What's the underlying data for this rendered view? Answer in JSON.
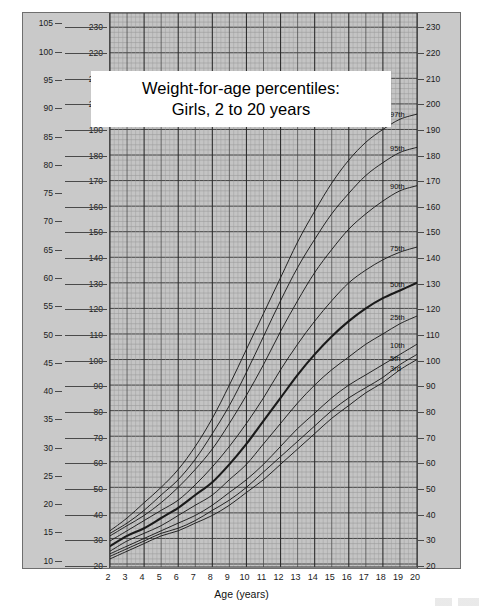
{
  "title": {
    "line1": "Weight-for-age percentiles:",
    "line2": "Girls, 2 to 20 years"
  },
  "axes": {
    "left_kg_unit": "kg",
    "left_lb_unit": "lb",
    "right_lb_unit": "lb",
    "x_title": "Age (years)",
    "kg_ticks": [
      10,
      15,
      20,
      25,
      30,
      35,
      40,
      45,
      50,
      55,
      60,
      65,
      70,
      75,
      80,
      85,
      90,
      95,
      100,
      105
    ],
    "lb_ticks": [
      20,
      30,
      40,
      50,
      60,
      70,
      80,
      90,
      100,
      110,
      120,
      130,
      140,
      150,
      160,
      170,
      180,
      190,
      200,
      210,
      220,
      230
    ],
    "x_ticks": [
      2,
      3,
      4,
      5,
      6,
      7,
      8,
      9,
      10,
      11,
      12,
      13,
      14,
      15,
      16,
      17,
      18,
      19,
      20
    ]
  },
  "chart_data": {
    "type": "line",
    "title": "Weight-for-age percentiles: Girls, 2 to 20 years",
    "xlabel": "Age (years)",
    "ylabel": "Weight (lb / kg)",
    "xlim": [
      2,
      20
    ],
    "ylim_lb": [
      20,
      234
    ],
    "ylim_kg": [
      9.07,
      106.1
    ],
    "grid": true,
    "legend": "right-edge curve labels",
    "x": [
      2,
      3,
      4,
      5,
      6,
      7,
      8,
      9,
      10,
      11,
      12,
      13,
      14,
      15,
      16,
      17,
      18,
      19,
      20
    ],
    "series": [
      {
        "name": "97th",
        "label": "97th",
        "emphasis": false,
        "values": [
          33,
          38,
          44,
          50,
          57,
          66,
          77,
          90,
          104,
          118,
          132,
          146,
          158,
          169,
          178,
          185,
          190,
          194,
          196
        ]
      },
      {
        "name": "95th",
        "label": "95th",
        "emphasis": false,
        "values": [
          32,
          36,
          41,
          47,
          53,
          61,
          71,
          82,
          95,
          109,
          123,
          136,
          147,
          157,
          165,
          172,
          177,
          181,
          183
        ]
      },
      {
        "name": "90th",
        "label": "90th",
        "emphasis": false,
        "values": [
          31,
          35,
          39,
          44,
          50,
          57,
          65,
          75,
          86,
          98,
          111,
          123,
          134,
          143,
          151,
          157,
          162,
          166,
          168
        ]
      },
      {
        "name": "75th",
        "label": "75th",
        "emphasis": false,
        "values": [
          29,
          33,
          37,
          41,
          45,
          51,
          58,
          66,
          75,
          85,
          96,
          106,
          115,
          123,
          130,
          135,
          139,
          142,
          144
        ]
      },
      {
        "name": "50th",
        "label": "50th",
        "emphasis": true,
        "values": [
          27,
          31,
          34,
          38,
          42,
          47,
          52,
          59,
          67,
          76,
          85,
          94,
          102,
          109,
          115,
          120,
          124,
          127,
          130
        ]
      },
      {
        "name": "25th",
        "label": "25th",
        "emphasis": false,
        "values": [
          25,
          29,
          32,
          35,
          39,
          43,
          47,
          53,
          59,
          67,
          75,
          83,
          90,
          96,
          101,
          106,
          110,
          114,
          117
        ]
      },
      {
        "name": "10th",
        "label": "10th",
        "emphasis": false,
        "values": [
          24,
          27,
          30,
          33,
          36,
          39,
          43,
          48,
          53,
          59,
          66,
          73,
          79,
          85,
          90,
          94,
          98,
          102,
          106
        ]
      },
      {
        "name": "5th",
        "label": "5th",
        "emphasis": false,
        "values": [
          23,
          26,
          29,
          32,
          34,
          37,
          41,
          45,
          50,
          56,
          62,
          68,
          74,
          80,
          85,
          89,
          93,
          98,
          102
        ]
      },
      {
        "name": "3rd",
        "label": "3rd",
        "emphasis": false,
        "values": [
          22,
          25,
          28,
          31,
          33,
          36,
          39,
          43,
          48,
          53,
          59,
          65,
          71,
          77,
          82,
          87,
          91,
          96,
          100
        ]
      }
    ],
    "curve_labels": [
      {
        "text": "97th",
        "lb": 196
      },
      {
        "text": "95th",
        "lb": 183
      },
      {
        "text": "90th",
        "lb": 168
      },
      {
        "text": "75th",
        "lb": 144
      },
      {
        "text": "50th",
        "lb": 130
      },
      {
        "text": "25th",
        "lb": 117
      },
      {
        "text": "10th",
        "lb": 106
      },
      {
        "text": "5th",
        "lb": 101
      },
      {
        "text": "3rd",
        "lb": 97
      }
    ]
  },
  "colors": {
    "panel_bg": "#c9c9c9",
    "plot_bg": "#c4c4c4",
    "grid_major": "#3a3a3a",
    "grid_minor": "#8d8d8d",
    "curve": "#1a1a1a",
    "text": "#111111"
  }
}
